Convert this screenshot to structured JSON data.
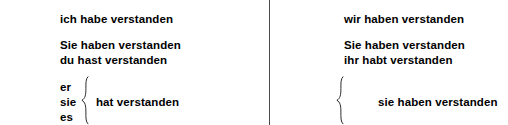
{
  "document": {
    "language": "German",
    "type": "verb-conjugation-table",
    "verb_phrase": "verstehen (Perfekt)",
    "background_color": "#ffffff",
    "text_color": "#000000",
    "divider_color": "#4a4a4a"
  },
  "columns": {
    "left": {
      "label": "singular",
      "first_person": "ich habe verstanden",
      "polite": "Sie haben verstanden",
      "second_person": "du hast verstanden",
      "third_person_pronouns": [
        "er",
        "sie",
        "es"
      ],
      "third_person_verb": "hat verstanden"
    },
    "right": {
      "label": "plural",
      "first_person": "wir haben verstanden",
      "polite": "Sie haben verstanden",
      "second_person": "ihr habt verstanden",
      "third_person_pronouns": [],
      "third_person_verb": "sie haben verstanden"
    }
  },
  "icons": {
    "brace_left": "curly-brace",
    "brace_right": "curly-brace"
  }
}
